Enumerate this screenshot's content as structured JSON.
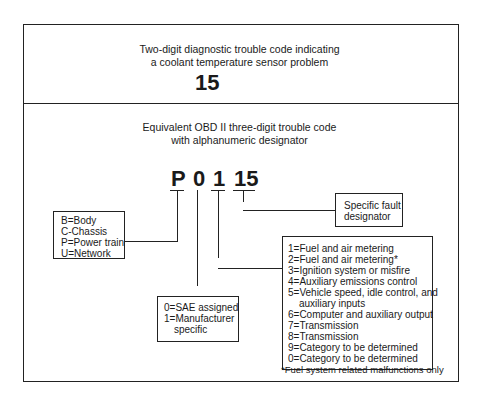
{
  "top_panel": {
    "title_line1": "Two-digit diagnostic trouble code indicating",
    "title_line2": "a coolant temperature sensor problem",
    "code": "15"
  },
  "bottom_panel": {
    "title_line1": "Equivalent OBD II three-digit trouble code",
    "title_line2": "with alphanumeric designator",
    "code_parts": [
      "P",
      "0",
      "1",
      "15"
    ]
  },
  "boxes": {
    "system": [
      "B=Body",
      "C-Chassis",
      "P=Power train",
      "U=Network"
    ],
    "code_type": [
      "0=SAE assigned",
      "1=Manufacturer",
      "specific"
    ],
    "fault": [
      "Specific fault",
      "designator"
    ],
    "subsystem": [
      "1=Fuel and air metering",
      "2=Fuel and air metering*",
      "3=Ignition system or misfire",
      "4=Auxiliary emissions control",
      "5=Vehicle speed, idle control, and",
      "auxiliary inputs",
      "6=Computer and auxiliary output",
      "7=Transmission",
      "8=Transmission",
      "9=Category to be determined",
      "0=Category to be determined"
    ]
  },
  "footnote": "*Fuel system related malfunctions only"
}
